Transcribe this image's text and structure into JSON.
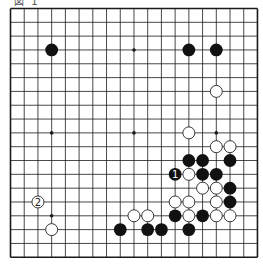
{
  "diagram": {
    "caption": "図 1",
    "board_size": 19,
    "colors": {
      "background": "#ffffff",
      "grid": "#1a1a1a",
      "black_stone": "#111111",
      "white_stone_fill": "#ffffff",
      "white_stone_stroke": "#222222",
      "label_on_black": "#ffffff",
      "label_on_white": "#222222"
    },
    "star_points": [
      [
        3,
        3
      ],
      [
        9,
        3
      ],
      [
        15,
        3
      ],
      [
        3,
        9
      ],
      [
        9,
        9
      ],
      [
        15,
        9
      ],
      [
        3,
        15
      ],
      [
        9,
        15
      ],
      [
        15,
        15
      ]
    ],
    "stones": [
      {
        "color": "black",
        "col": 3,
        "row": 3
      },
      {
        "color": "black",
        "col": 13,
        "row": 3
      },
      {
        "color": "black",
        "col": 15,
        "row": 3
      },
      {
        "color": "white",
        "col": 15,
        "row": 6
      },
      {
        "color": "white",
        "col": 13,
        "row": 9
      },
      {
        "color": "white",
        "col": 15,
        "row": 10
      },
      {
        "color": "white",
        "col": 16,
        "row": 10
      },
      {
        "color": "black",
        "col": 13,
        "row": 11
      },
      {
        "color": "black",
        "col": 14,
        "row": 11
      },
      {
        "color": "black",
        "col": 16,
        "row": 11
      },
      {
        "color": "black",
        "col": 12,
        "row": 12,
        "label": "1"
      },
      {
        "color": "white",
        "col": 13,
        "row": 12
      },
      {
        "color": "black",
        "col": 14,
        "row": 12
      },
      {
        "color": "black",
        "col": 15,
        "row": 12
      },
      {
        "color": "white",
        "col": 14,
        "row": 13
      },
      {
        "color": "white",
        "col": 15,
        "row": 13
      },
      {
        "color": "black",
        "col": 16,
        "row": 13
      },
      {
        "color": "white",
        "col": 2,
        "row": 14,
        "label": "2",
        "marked": true
      },
      {
        "color": "white",
        "col": 12,
        "row": 14
      },
      {
        "color": "white",
        "col": 13,
        "row": 14
      },
      {
        "color": "white",
        "col": 15,
        "row": 14
      },
      {
        "color": "black",
        "col": 16,
        "row": 14
      },
      {
        "color": "white",
        "col": 9,
        "row": 15
      },
      {
        "color": "white",
        "col": 10,
        "row": 15
      },
      {
        "color": "black",
        "col": 12,
        "row": 15
      },
      {
        "color": "white",
        "col": 13,
        "row": 15
      },
      {
        "color": "black",
        "col": 14,
        "row": 15
      },
      {
        "color": "white",
        "col": 15,
        "row": 15
      },
      {
        "color": "white",
        "col": 16,
        "row": 15
      },
      {
        "color": "white",
        "col": 3,
        "row": 16
      },
      {
        "color": "black",
        "col": 8,
        "row": 16
      },
      {
        "color": "black",
        "col": 10,
        "row": 16
      },
      {
        "color": "black",
        "col": 11,
        "row": 16
      },
      {
        "color": "black",
        "col": 13,
        "row": 16
      }
    ],
    "move_labels": [
      {
        "label": "1",
        "color": "black",
        "col": 12,
        "row": 12
      },
      {
        "label": "2",
        "color": "white",
        "col": 2,
        "row": 14
      }
    ]
  }
}
